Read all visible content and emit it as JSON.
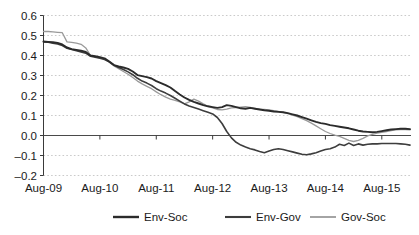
{
  "chart_data": {
    "type": "line",
    "title": "",
    "subtitle": "",
    "xlabel": "",
    "ylabel": "",
    "grid": true,
    "legend_position": "bottom",
    "ylim": [
      -0.2,
      0.6
    ],
    "yticks": [
      "0.6",
      "0.5",
      "0.4",
      "0.3",
      "0.2",
      "0.1",
      "0.0",
      "–0.1",
      "–0.2"
    ],
    "ytick_values": [
      0.6,
      0.5,
      0.4,
      0.3,
      0.2,
      0.1,
      0.0,
      -0.1,
      -0.2
    ],
    "xtick_labels": [
      "Aug-09",
      "Aug-10",
      "Aug-11",
      "Aug-12",
      "Aug-13",
      "Aug-14",
      "Aug-15"
    ],
    "xtick_values": [
      0,
      12,
      24,
      36,
      48,
      60,
      72
    ],
    "xlim": [
      0,
      78
    ],
    "x": [
      0,
      1,
      2,
      3,
      4,
      5,
      6,
      7,
      8,
      9,
      10,
      11,
      12,
      13,
      14,
      15,
      16,
      17,
      18,
      19,
      20,
      21,
      22,
      23,
      24,
      25,
      26,
      27,
      28,
      29,
      30,
      31,
      32,
      33,
      34,
      35,
      36,
      37,
      38,
      39,
      40,
      41,
      42,
      43,
      44,
      45,
      46,
      47,
      48,
      49,
      50,
      51,
      52,
      53,
      54,
      55,
      56,
      57,
      58,
      59,
      60,
      61,
      62,
      63,
      64,
      65,
      66,
      67,
      68,
      69,
      70,
      71,
      72,
      73,
      74,
      75,
      76,
      77,
      78
    ],
    "series": [
      {
        "name": "Env-Soc",
        "color": "#2b2b2b",
        "width": 1.9,
        "values": [
          0.47,
          0.468,
          0.466,
          0.463,
          0.455,
          0.44,
          0.432,
          0.428,
          0.424,
          0.418,
          0.4,
          0.396,
          0.392,
          0.386,
          0.37,
          0.352,
          0.345,
          0.34,
          0.333,
          0.32,
          0.302,
          0.297,
          0.292,
          0.285,
          0.272,
          0.262,
          0.252,
          0.24,
          0.222,
          0.205,
          0.19,
          0.178,
          0.168,
          0.16,
          0.152,
          0.146,
          0.142,
          0.138,
          0.142,
          0.152,
          0.148,
          0.142,
          0.136,
          0.134,
          0.138,
          0.134,
          0.13,
          0.126,
          0.124,
          0.12,
          0.118,
          0.116,
          0.112,
          0.106,
          0.1,
          0.092,
          0.084,
          0.076,
          0.068,
          0.062,
          0.058,
          0.052,
          0.048,
          0.044,
          0.04,
          0.036,
          0.03,
          0.024,
          0.02,
          0.018,
          0.016,
          0.018,
          0.022,
          0.026,
          0.03,
          0.032,
          0.034,
          0.034,
          0.032
        ]
      },
      {
        "name": "Env-Gov",
        "color": "#3d3d3d",
        "width": 1.6,
        "values": [
          0.468,
          0.466,
          0.462,
          0.458,
          0.45,
          0.436,
          0.43,
          0.424,
          0.418,
          0.412,
          0.396,
          0.392,
          0.386,
          0.38,
          0.368,
          0.352,
          0.34,
          0.33,
          0.318,
          0.304,
          0.286,
          0.272,
          0.262,
          0.25,
          0.234,
          0.222,
          0.212,
          0.2,
          0.186,
          0.172,
          0.158,
          0.148,
          0.14,
          0.132,
          0.124,
          0.116,
          0.108,
          0.09,
          0.06,
          0.02,
          -0.012,
          -0.034,
          -0.048,
          -0.058,
          -0.066,
          -0.072,
          -0.08,
          -0.086,
          -0.078,
          -0.07,
          -0.066,
          -0.07,
          -0.076,
          -0.082,
          -0.088,
          -0.094,
          -0.096,
          -0.092,
          -0.086,
          -0.078,
          -0.07,
          -0.066,
          -0.058,
          -0.044,
          -0.05,
          -0.038,
          -0.05,
          -0.042,
          -0.048,
          -0.044,
          -0.042,
          -0.042,
          -0.04,
          -0.04,
          -0.04,
          -0.04,
          -0.042,
          -0.044,
          -0.048
        ]
      },
      {
        "name": "Gov-Soc",
        "color": "#9a9a9a",
        "width": 1.3,
        "values": [
          0.52,
          0.52,
          0.518,
          0.516,
          0.514,
          0.468,
          0.466,
          0.462,
          0.456,
          0.438,
          0.4,
          0.394,
          0.388,
          0.382,
          0.366,
          0.348,
          0.334,
          0.32,
          0.306,
          0.29,
          0.272,
          0.258,
          0.246,
          0.234,
          0.218,
          0.204,
          0.192,
          0.182,
          0.176,
          0.168,
          0.158,
          0.168,
          0.182,
          0.172,
          0.158,
          0.146,
          0.138,
          0.13,
          0.128,
          0.132,
          0.138,
          0.14,
          0.142,
          0.144,
          0.14,
          0.136,
          0.132,
          0.13,
          0.128,
          0.124,
          0.12,
          0.116,
          0.11,
          0.102,
          0.094,
          0.084,
          0.074,
          0.062,
          0.048,
          0.034,
          0.02,
          0.01,
          0.002,
          -0.004,
          -0.014,
          -0.024,
          -0.03,
          -0.024,
          -0.014,
          -0.002,
          0.006,
          0.012,
          0.016,
          0.02,
          0.024,
          0.028,
          0.03,
          0.03,
          0.028
        ]
      }
    ]
  },
  "legend": {
    "items": [
      {
        "label": "Env-Soc"
      },
      {
        "label": "Env-Gov"
      },
      {
        "label": "Gov-Soc"
      }
    ]
  }
}
